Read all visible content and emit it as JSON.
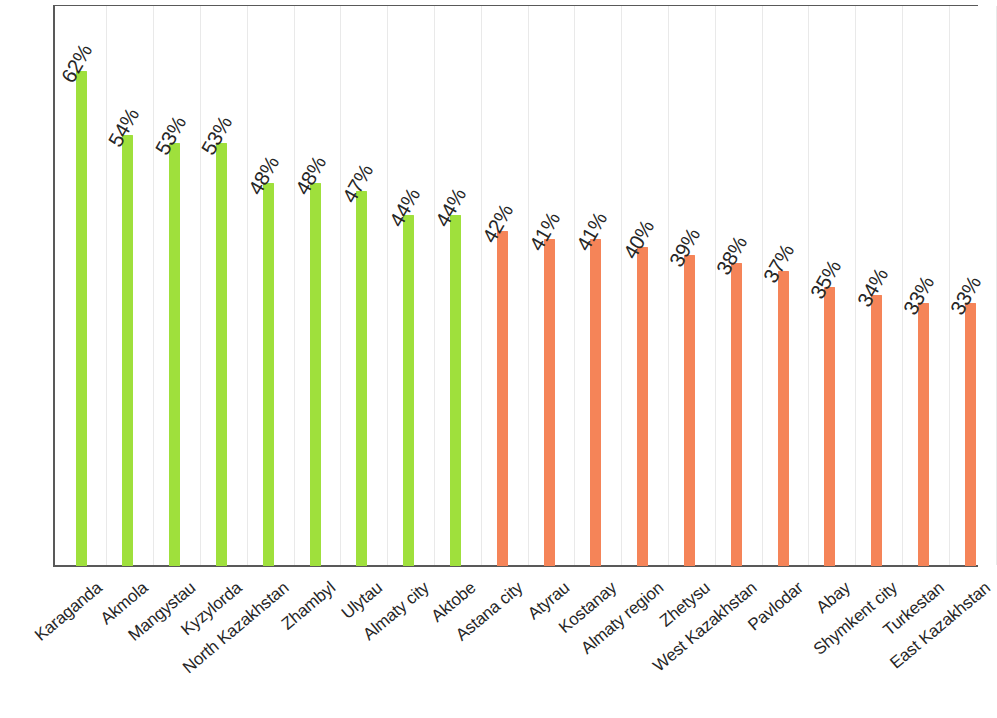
{
  "chart_data": {
    "type": "bar",
    "title": "",
    "subtitle": "",
    "xlabel": "",
    "ylabel": "",
    "ylim": [
      0,
      70
    ],
    "grid": "vertical-faint",
    "legend": "none",
    "value_suffix": "%",
    "categories": [
      "Karaganda",
      "Akmola",
      "Mangystau",
      "Kyzylorda",
      "North Kazakhstan",
      "Zhambyl",
      "Ulytau",
      "Almaty city",
      "Aktobe",
      "Astana city",
      "Atyrau",
      "Kostanay",
      "Almaty region",
      "Zhetysu",
      "West Kazakhstan",
      "Pavlodar",
      "Abay",
      "Shymkent city",
      "Turkestan",
      "East Kazakhstan"
    ],
    "values": [
      62,
      54,
      53,
      53,
      48,
      48,
      47,
      44,
      44,
      42,
      41,
      41,
      40,
      39,
      38,
      37,
      35,
      34,
      33,
      33
    ],
    "value_labels": [
      "62%",
      "54%",
      "53%",
      "53%",
      "48%",
      "48%",
      "47%",
      "44%",
      "44%",
      "42%",
      "41%",
      "41%",
      "40%",
      "39%",
      "38%",
      "37%",
      "35%",
      "34%",
      "33%",
      "33%"
    ],
    "colors": [
      "#9FE03C",
      "#9FE03C",
      "#9FE03C",
      "#9FE03C",
      "#9FE03C",
      "#9FE03C",
      "#9FE03C",
      "#9FE03C",
      "#9FE03C",
      "#F58458",
      "#F58458",
      "#F58458",
      "#F58458",
      "#F58458",
      "#F58458",
      "#F58458",
      "#F58458",
      "#F58458",
      "#F58458",
      "#F58458"
    ],
    "series_colors": {
      "above_average": "#9FE03C",
      "below_average": "#F58458"
    },
    "axis_color": "#595959",
    "gridline_color": "#E9E9E9",
    "label_color": "#262626"
  }
}
